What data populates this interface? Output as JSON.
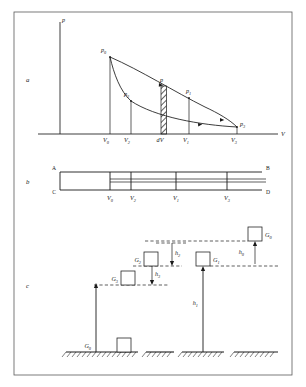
{
  "figure": {
    "panels": [
      {
        "id": "a",
        "label": "a"
      },
      {
        "id": "b",
        "label": "b"
      },
      {
        "id": "c",
        "label": "c"
      }
    ]
  },
  "panel_a": {
    "axis": {
      "y_label": "p",
      "x_label": "V"
    },
    "curve_labels": [
      {
        "name": "p0",
        "text": "p",
        "sub": "0"
      },
      {
        "name": "p2",
        "text": "p",
        "sub": "2"
      },
      {
        "name": "p",
        "text": "p",
        "sub": ""
      },
      {
        "name": "p1",
        "text": "p",
        "sub": "1"
      },
      {
        "name": "p3",
        "text": "p",
        "sub": "3"
      }
    ],
    "x_ticks": [
      {
        "name": "V0",
        "text": "V",
        "sub": "0"
      },
      {
        "name": "V2",
        "text": "V",
        "sub": "2"
      },
      {
        "name": "dV",
        "text": "dV",
        "sub": ""
      },
      {
        "name": "V1",
        "text": "V",
        "sub": "1"
      },
      {
        "name": "V3",
        "text": "V",
        "sub": "3"
      }
    ]
  },
  "panel_b": {
    "corners": [
      {
        "name": "A",
        "text": "A"
      },
      {
        "name": "B",
        "text": "B"
      },
      {
        "name": "C",
        "text": "C"
      },
      {
        "name": "D",
        "text": "D"
      }
    ],
    "x_ticks": [
      {
        "name": "V0",
        "text": "V",
        "sub": "0"
      },
      {
        "name": "V2",
        "text": "V",
        "sub": "2"
      },
      {
        "name": "V1",
        "text": "V",
        "sub": "1"
      },
      {
        "name": "V3",
        "text": "V",
        "sub": "3"
      }
    ]
  },
  "panel_c": {
    "weights": [
      {
        "name": "G0-bottom",
        "text": "G",
        "sub": "0"
      },
      {
        "name": "G3",
        "text": "G",
        "sub": "3"
      },
      {
        "name": "G2",
        "text": "G",
        "sub": "2"
      },
      {
        "name": "G1",
        "text": "G",
        "sub": "1"
      },
      {
        "name": "G0-top",
        "text": "G",
        "sub": "0"
      }
    ],
    "heights": [
      {
        "name": "h3",
        "text": "h",
        "sub": "3"
      },
      {
        "name": "h2",
        "text": "h",
        "sub": "2"
      },
      {
        "name": "h1",
        "text": "h",
        "sub": "1"
      },
      {
        "name": "h0",
        "text": "h",
        "sub": "0"
      }
    ]
  },
  "colors": {
    "ink": "#1a1a1a",
    "frame": "#5a5a5a",
    "paper": "#ffffff"
  }
}
